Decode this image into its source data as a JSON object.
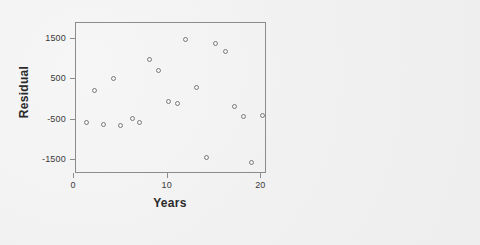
{
  "figure": {
    "background_color": "#f0f0f0",
    "frame_color": "#8c8c8c",
    "marker_color": "#7a7a7a",
    "text_color": "#2b2b2b"
  },
  "chart_data": {
    "type": "scatter",
    "title": "",
    "xlabel": "Years",
    "ylabel": "Residual",
    "xlim": [
      0.2,
      20.6
    ],
    "ylim": [
      -1850,
      1900
    ],
    "xticks": [
      0,
      10,
      20
    ],
    "xtick_labels": [
      "0",
      "10",
      "20"
    ],
    "yticks": [
      1500,
      500,
      -500,
      -1500
    ],
    "ytick_labels": [
      "1500",
      "500",
      "-500",
      "-1500"
    ],
    "grid": false,
    "legend": null,
    "marker": "open-circle",
    "series": [
      {
        "name": "Residuals",
        "x": [
          1.3,
          2.2,
          3.1,
          4.2,
          5.0,
          6.2,
          7.0,
          8.0,
          9.0,
          10.1,
          11.0,
          11.9,
          13.1,
          14.1,
          15.1,
          16.2,
          17.1,
          18.1,
          18.9,
          20.1
        ],
        "y": [
          -560,
          220,
          -620,
          520,
          -650,
          -480,
          -570,
          1000,
          720,
          -40,
          -110,
          1500,
          290,
          -1450,
          1400,
          1200,
          -180,
          -420,
          -1570,
          -400
        ]
      }
    ],
    "points": [
      {
        "x": 1.3,
        "y": -560
      },
      {
        "x": 2.2,
        "y": 220
      },
      {
        "x": 3.1,
        "y": -620
      },
      {
        "x": 4.2,
        "y": 520
      },
      {
        "x": 5.0,
        "y": -650
      },
      {
        "x": 6.2,
        "y": -480
      },
      {
        "x": 7.0,
        "y": -570
      },
      {
        "x": 8.0,
        "y": 1000
      },
      {
        "x": 9.0,
        "y": 720
      },
      {
        "x": 10.1,
        "y": -40
      },
      {
        "x": 11.0,
        "y": -110
      },
      {
        "x": 11.9,
        "y": 1500
      },
      {
        "x": 13.1,
        "y": 290
      },
      {
        "x": 14.1,
        "y": -1450
      },
      {
        "x": 15.1,
        "y": 1400
      },
      {
        "x": 16.2,
        "y": 1200
      },
      {
        "x": 17.1,
        "y": -180
      },
      {
        "x": 18.1,
        "y": -420
      },
      {
        "x": 18.9,
        "y": -1570
      },
      {
        "x": 20.1,
        "y": -400
      }
    ]
  }
}
